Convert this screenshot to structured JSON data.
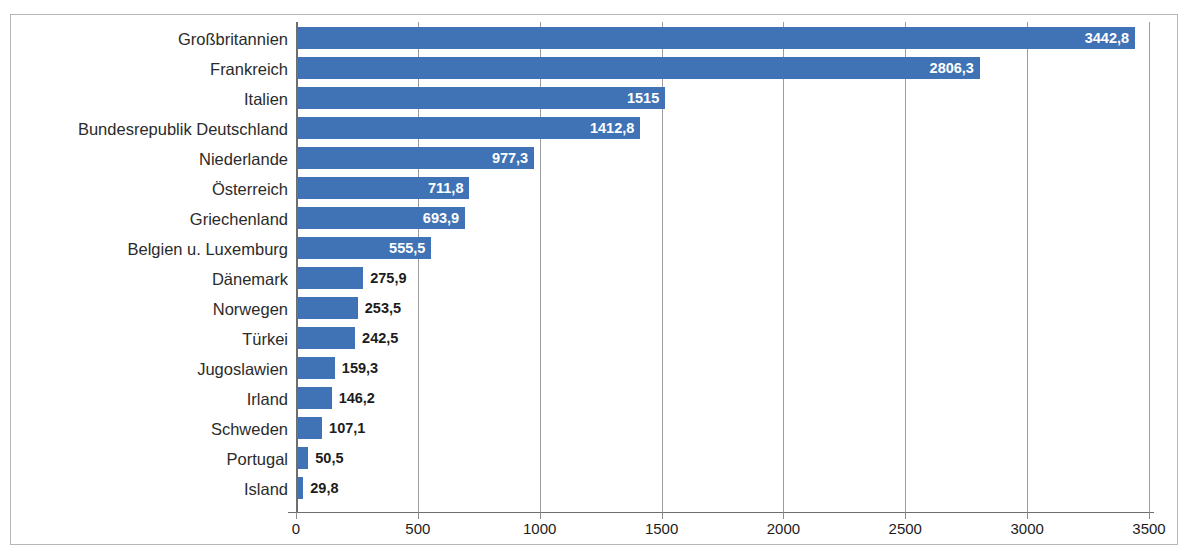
{
  "top_fragment": "",
  "chart_data": {
    "type": "bar",
    "orientation": "horizontal",
    "title": "",
    "subtitle": "",
    "xlabel": "",
    "ylabel": "",
    "xlim": [
      0,
      3500
    ],
    "xticks": [
      "0",
      "500",
      "1000",
      "1500",
      "2000",
      "2500",
      "3000",
      "3500"
    ],
    "xtick_values": [
      0,
      500,
      1000,
      1500,
      2000,
      2500,
      3000,
      3500
    ],
    "grid": "vertical",
    "legend": "none",
    "bar_color": "#3f73b5",
    "label_inside_color": "#ffffff",
    "label_outside_color": "#1c1c1c",
    "categories": [
      "Großbritannien",
      "Frankreich",
      "Italien",
      "Bundesrepublik Deutschland",
      "Niederlande",
      "Österreich",
      "Griechenland",
      "Belgien u. Luxemburg",
      "Dänemark",
      "Norwegen",
      "Türkei",
      "Jugoslawien",
      "Irland",
      "Schweden",
      "Portugal",
      "Island"
    ],
    "values": [
      3442.8,
      2806.3,
      1515,
      1412.8,
      977.3,
      711.8,
      693.9,
      555.5,
      275.9,
      253.5,
      242.5,
      159.3,
      146.2,
      107.1,
      50.5,
      29.8
    ],
    "value_labels": [
      "3442,8",
      "2806,3",
      "1515",
      "1412,8",
      "977,3",
      "711,8",
      "693,9",
      "555,5",
      "275,9",
      "253,5",
      "242,5",
      "159,3",
      "146,2",
      "107,1",
      "50,5",
      "29,8"
    ],
    "label_placement": [
      "inside",
      "inside",
      "inside",
      "inside",
      "inside",
      "inside",
      "inside",
      "inside",
      "outside",
      "outside",
      "outside",
      "outside",
      "outside",
      "outside",
      "outside",
      "outside"
    ]
  }
}
